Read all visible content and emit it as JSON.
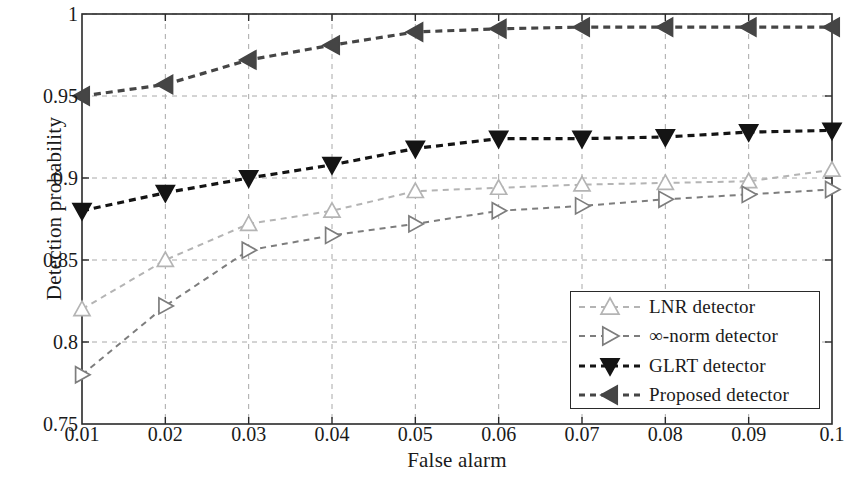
{
  "chart_data": {
    "type": "line",
    "title": "",
    "xlabel": "False alarm",
    "ylabel": "Detection probability",
    "x": [
      0.01,
      0.02,
      0.03,
      0.04,
      0.05,
      0.06,
      0.07,
      0.08,
      0.09,
      0.1
    ],
    "xlim": [
      0.01,
      0.1
    ],
    "ylim": [
      0.75,
      1.0
    ],
    "xticks": [
      "0.01",
      "0.02",
      "0.03",
      "0.04",
      "0.05",
      "0.06",
      "0.07",
      "0.08",
      "0.09",
      "0.1"
    ],
    "yticks": [
      "0.75",
      "0.8",
      "0.85",
      "0.9",
      "0.95",
      "1"
    ],
    "grid": true,
    "legend_position": "lower right",
    "series": [
      {
        "name": "LNR detector",
        "color": "#b4b4b4",
        "marker": "triangle-up",
        "linestyle": "dashed",
        "values": [
          0.82,
          0.85,
          0.872,
          0.88,
          0.892,
          0.894,
          0.896,
          0.897,
          0.898,
          0.905
        ]
      },
      {
        "name": "∞-norm detector",
        "color": "#7d7d7d",
        "marker": "triangle-right",
        "linestyle": "dashed",
        "values": [
          0.78,
          0.822,
          0.856,
          0.865,
          0.872,
          0.88,
          0.883,
          0.887,
          0.89,
          0.893
        ]
      },
      {
        "name": "GLRT detector",
        "color": "#141414",
        "marker": "triangle-down",
        "linestyle": "dashed",
        "values": [
          0.88,
          0.891,
          0.9,
          0.908,
          0.918,
          0.924,
          0.924,
          0.925,
          0.928,
          0.929
        ]
      },
      {
        "name": "Proposed detector",
        "color": "#454545",
        "marker": "triangle-left",
        "linestyle": "dashed",
        "values": [
          0.95,
          0.957,
          0.972,
          0.981,
          0.989,
          0.991,
          0.992,
          0.992,
          0.992,
          0.992
        ]
      }
    ]
  },
  "axes": {
    "frame_color": "#2a2a2a",
    "grid_color": "#a8a8a8",
    "background": "#ffffff"
  }
}
